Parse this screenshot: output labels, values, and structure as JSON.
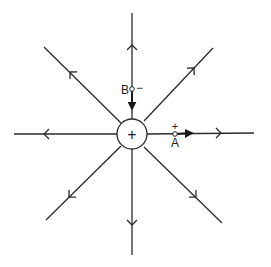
{
  "diagram": {
    "central_charge": {
      "sign": "+",
      "cx": 132,
      "cy": 134,
      "r": 15
    },
    "field_lines": [
      {
        "name": "up",
        "x1": 132,
        "y1": 119,
        "x2": 132,
        "y2": 13,
        "arrow_at": [
          132,
          45
        ],
        "dir": "out"
      },
      {
        "name": "down",
        "x1": 132,
        "y1": 149,
        "x2": 132,
        "y2": 255,
        "arrow_at": [
          132,
          225
        ],
        "dir": "out"
      },
      {
        "name": "left",
        "x1": 117,
        "y1": 134,
        "x2": 14,
        "y2": 134,
        "arrow_at": [
          44,
          134
        ],
        "dir": "out"
      },
      {
        "name": "right",
        "x1": 147,
        "y1": 134,
        "x2": 254,
        "y2": 133,
        "arrow_at": [
          221,
          133
        ],
        "dir": "out"
      },
      {
        "name": "upper-left",
        "x1": 121,
        "y1": 123,
        "x2": 44,
        "y2": 47,
        "arrow_at": [
          70,
          72
        ],
        "dir": "out"
      },
      {
        "name": "upper-right",
        "x1": 144,
        "y1": 121,
        "x2": 213,
        "y2": 48,
        "arrow_at": [
          194,
          68
        ],
        "dir": "out"
      },
      {
        "name": "lower-left",
        "x1": 121,
        "y1": 146,
        "x2": 46,
        "y2": 220,
        "arrow_at": [
          69,
          197
        ],
        "dir": "out"
      },
      {
        "name": "lower-right",
        "x1": 144,
        "y1": 147,
        "x2": 222,
        "y2": 223,
        "arrow_at": [
          196,
          197
        ],
        "dir": "out"
      }
    ],
    "points": {
      "A": {
        "label": "A",
        "sign": "+",
        "x": 175,
        "y": 134,
        "force_arrow_to": [
          192,
          133
        ]
      },
      "B": {
        "label": "B",
        "sign": "−",
        "x": 132,
        "y": 89,
        "force_arrow_to": [
          132,
          109
        ]
      }
    }
  }
}
